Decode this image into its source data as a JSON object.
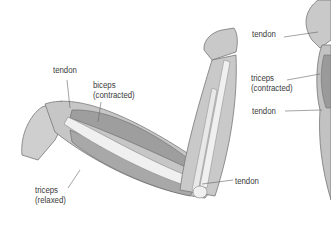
{
  "diagram": {
    "left_arm": {
      "labels": [
        {
          "id": "tendon_top",
          "line1": "tendon",
          "line2": ""
        },
        {
          "id": "biceps",
          "line1": "biceps",
          "line2": "(contracted)"
        },
        {
          "id": "tendon_elbow",
          "line1": "tendon",
          "line2": ""
        },
        {
          "id": "triceps",
          "line1": "triceps",
          "line2": "(relaxed)"
        }
      ]
    },
    "right_arm": {
      "labels": [
        {
          "id": "tendon_top",
          "line1": "tendon",
          "line2": ""
        },
        {
          "id": "triceps",
          "line1": "triceps",
          "line2": "(contracted)"
        },
        {
          "id": "tendon_bottom",
          "line1": "tendon",
          "line2": ""
        }
      ]
    },
    "colors": {
      "skin": "#c9c9c9",
      "muscle": "#a3a3a3",
      "bone": "#efefef",
      "outline": "#777777",
      "label": "#3a3a3a",
      "leader": "#666666"
    }
  }
}
